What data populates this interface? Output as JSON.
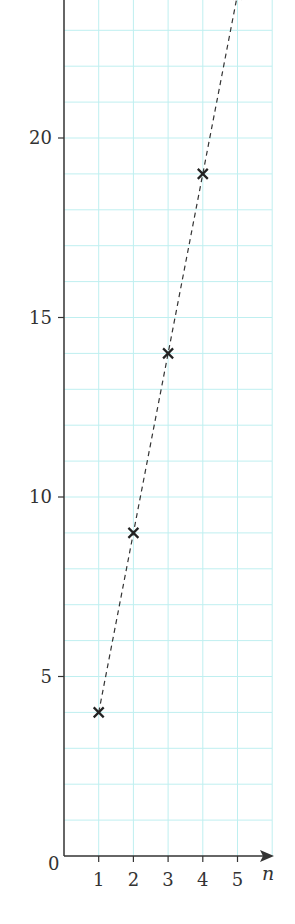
{
  "chart_data": {
    "type": "scatter",
    "title": "",
    "xlabel": "n",
    "ylabel": "",
    "x": [
      1,
      2,
      3,
      4,
      5
    ],
    "series": [
      {
        "name": "terms",
        "values": [
          4,
          9,
          14,
          19,
          24
        ],
        "marker": "x",
        "line": "dashed"
      }
    ],
    "x_ticks": [
      "1",
      "2",
      "3",
      "4",
      "5"
    ],
    "y_ticks": [
      "5",
      "10",
      "15",
      "20"
    ],
    "origin_label": "0",
    "xlim": [
      0,
      6
    ],
    "ylim": [
      0,
      24
    ],
    "grid": true,
    "grid_color": "#bfeff0",
    "axis_color": "#333333",
    "marker_color": "#222222"
  }
}
